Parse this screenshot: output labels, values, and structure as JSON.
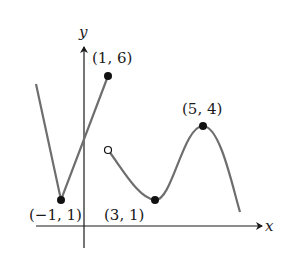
{
  "diagram": {
    "type": "function-graph",
    "axes": {
      "x_label": "x",
      "y_label": "y"
    },
    "points": [
      {
        "label": "(1, 6)",
        "x": 1,
        "y": 6,
        "style": "closed"
      },
      {
        "label": "(−1, 1)",
        "x": -1,
        "y": 1,
        "style": "closed"
      },
      {
        "label": "(3, 1)",
        "x": 3,
        "y": 1,
        "style": "closed"
      },
      {
        "label": "(5, 4)",
        "x": 5,
        "y": 4,
        "style": "closed"
      },
      {
        "label": "",
        "x": 1,
        "y": 3,
        "style": "open"
      }
    ],
    "colors": {
      "curve": "#6e6e6e",
      "axis": "#1a1a1a",
      "point": "#111111"
    }
  }
}
